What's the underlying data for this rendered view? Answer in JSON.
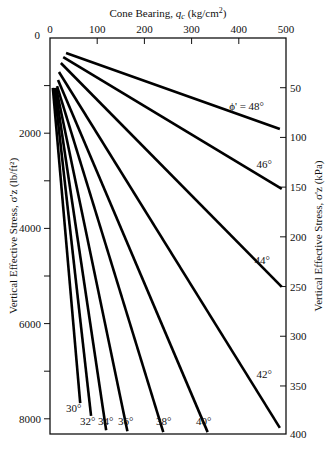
{
  "chart_data": {
    "type": "line",
    "title": "",
    "x_axis_top": {
      "label": "Cone Bearing, q_c (kg/cm²)",
      "label_main": "Cone Bearing, ",
      "label_sym": "q",
      "label_sub": "c",
      "label_unit": " (kg/cm",
      "label_sup": "2",
      "label_close": ")",
      "range": [
        0,
        500
      ],
      "ticks": [
        0,
        100,
        200,
        300,
        400,
        500
      ]
    },
    "y_axis_left": {
      "label": "Vertical Effective Stress, σ'z (lb/ft²)",
      "range": [
        0,
        8300
      ],
      "inverted": true,
      "ticks": [
        0,
        2000,
        4000,
        6000,
        8000
      ],
      "minor_ticks": [
        1000,
        3000,
        5000,
        7000
      ]
    },
    "y_axis_right": {
      "label": "Vertical Effective Stress, σ'z (kPa)",
      "range": [
        0,
        400
      ],
      "inverted": true,
      "ticks": [
        50,
        100,
        150,
        200,
        250,
        300,
        350,
        400
      ]
    },
    "grid": false,
    "legend": "inline labels at line ends",
    "series": [
      {
        "name": "φ' = 48°",
        "label": "ϕ' = 48°",
        "x": [
          34,
          487
        ],
        "y": [
          315,
          1910
        ]
      },
      {
        "name": "46°",
        "label": "46°",
        "x": [
          28,
          491
        ],
        "y": [
          400,
          3170
        ]
      },
      {
        "name": "44°",
        "label": "44°",
        "x": [
          23,
          491
        ],
        "y": [
          525,
          5230
        ]
      },
      {
        "name": "42°",
        "label": "42°",
        "x": [
          19,
          487
        ],
        "y": [
          715,
          8190
        ]
      },
      {
        "name": "40°",
        "label": "40°",
        "x": [
          17,
          334
        ],
        "y": [
          880,
          8280
        ]
      },
      {
        "name": "38°",
        "label": "38°",
        "x": [
          15,
          240
        ],
        "y": [
          1010,
          8280
        ]
      },
      {
        "name": "36°",
        "label": "36°",
        "x": [
          13,
          164
        ],
        "y": [
          1050,
          8260
        ]
      },
      {
        "name": "34°",
        "label": "34°",
        "x": [
          11,
          119
        ],
        "y": [
          1050,
          8240
        ]
      },
      {
        "name": "32°",
        "label": "32°",
        "x": [
          9,
          87
        ],
        "y": [
          1050,
          7940
        ]
      },
      {
        "name": "30°",
        "label": "30°",
        "x": [
          6,
          64
        ],
        "y": [
          1050,
          7670
        ]
      }
    ]
  }
}
